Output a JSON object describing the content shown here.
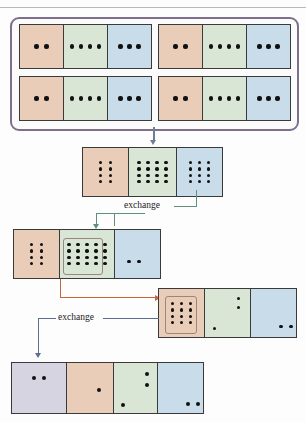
{
  "diagram": {
    "labels": {
      "exchange_1": "exchange",
      "exchange_2": "exchange"
    },
    "colors": {
      "pink": "#e9cdb9",
      "green": "#d9e5d5",
      "blue": "#c8dcea",
      "lavender": "#d6d4e0",
      "frame": "#7e6f8c",
      "cell_border": "#3a3a3a",
      "arrow_gray": "#6e7f93",
      "arrow_green": "#5f8f7d",
      "arrow_orange": "#c9643c",
      "arrow_blue": "#5d6e93",
      "dot": "#111111"
    },
    "rows": [
      {
        "name": "top-group-row-1",
        "groups": [
          {
            "name": "set-a",
            "cells": [
              {
                "color": "pink",
                "dots": 2,
                "cols": 2,
                "rows": 1
              },
              {
                "color": "green",
                "dots": 4,
                "cols": 4,
                "rows": 1
              },
              {
                "color": "blue",
                "dots": 3,
                "cols": 3,
                "rows": 1
              }
            ]
          },
          {
            "name": "set-b",
            "cells": [
              {
                "color": "pink",
                "dots": 2,
                "cols": 2,
                "rows": 1
              },
              {
                "color": "green",
                "dots": 4,
                "cols": 4,
                "rows": 1
              },
              {
                "color": "blue",
                "dots": 3,
                "cols": 3,
                "rows": 1
              }
            ]
          }
        ]
      },
      {
        "name": "top-group-row-2",
        "groups": [
          {
            "name": "set-c",
            "cells": [
              {
                "color": "pink",
                "dots": 2,
                "cols": 2,
                "rows": 1
              },
              {
                "color": "green",
                "dots": 4,
                "cols": 4,
                "rows": 1
              },
              {
                "color": "blue",
                "dots": 3,
                "cols": 3,
                "rows": 1
              }
            ]
          },
          {
            "name": "set-d",
            "cells": [
              {
                "color": "pink",
                "dots": 2,
                "cols": 2,
                "rows": 1
              },
              {
                "color": "green",
                "dots": 4,
                "cols": 4,
                "rows": 1
              },
              {
                "color": "blue",
                "dots": 3,
                "cols": 3,
                "rows": 1
              }
            ]
          }
        ]
      },
      {
        "name": "combined-row",
        "cells": [
          {
            "color": "pink",
            "dots": 8,
            "cols": 2,
            "rows": 4
          },
          {
            "color": "green",
            "dots": 16,
            "cols": 4,
            "rows": 4
          },
          {
            "color": "blue",
            "dots": 12,
            "cols": 3,
            "rows": 4
          }
        ]
      },
      {
        "name": "after-first-exchange-row",
        "cells": [
          {
            "color": "pink",
            "dots": 8,
            "cols": 2,
            "rows": 4
          },
          {
            "color": "green",
            "dots": 20,
            "cols": 5,
            "rows": 4,
            "highlight": "left-16"
          },
          {
            "color": "blue",
            "dots": 2,
            "cols": 2,
            "rows": 1
          }
        ]
      },
      {
        "name": "after-second-exchange-row",
        "cells": [
          {
            "color": "pink",
            "dots": 12,
            "cols": 3,
            "rows": 4,
            "highlight": "all-12"
          },
          {
            "color": "green",
            "dots": 3,
            "pattern": "scatter-3"
          },
          {
            "color": "blue",
            "dots": 2,
            "cols": 2,
            "rows": 1
          }
        ]
      },
      {
        "name": "final-row",
        "cells": [
          {
            "color": "lavender",
            "dots": 2,
            "cols": 2,
            "rows": 1
          },
          {
            "color": "pink",
            "dots": 1,
            "pattern": "single-center"
          },
          {
            "color": "green",
            "dots": 3,
            "pattern": "scatter-3"
          },
          {
            "color": "blue",
            "dots": 2,
            "cols": 2,
            "rows": 1
          }
        ]
      }
    ],
    "connectors": [
      {
        "name": "arrow-top-to-combined",
        "color": "arrow_gray",
        "direction": "down"
      },
      {
        "name": "arrow-exchange-1",
        "color": "arrow_green",
        "direction": "down"
      },
      {
        "name": "arrow-exchange-carry",
        "color": "arrow_orange",
        "direction": "right"
      },
      {
        "name": "arrow-exchange-2",
        "color": "arrow_blue",
        "direction": "down"
      }
    ]
  }
}
